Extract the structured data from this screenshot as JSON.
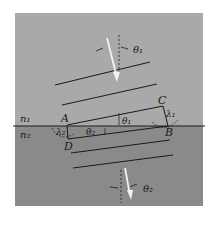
{
  "figure": {
    "type": "refraction-of-wavefronts",
    "colors": {
      "background": "#ffffff",
      "medium1": "#a9a9a9",
      "medium2": "#8a8a8a",
      "wavefront": "#1a1a1a",
      "ray": "#f2f2f2"
    },
    "media": {
      "upper": "n₁",
      "lower": "n₂"
    },
    "points": {
      "A": "A",
      "B": "B",
      "C": "C",
      "D": "D"
    },
    "angles": {
      "incident_top": "θ₁",
      "incident_at_interface": "θ₁",
      "refracted_at_interface": "θ₂",
      "refracted_bottom": "θ₂"
    },
    "wavelengths": {
      "medium1": "λ₁",
      "medium2": "λ₂"
    }
  }
}
